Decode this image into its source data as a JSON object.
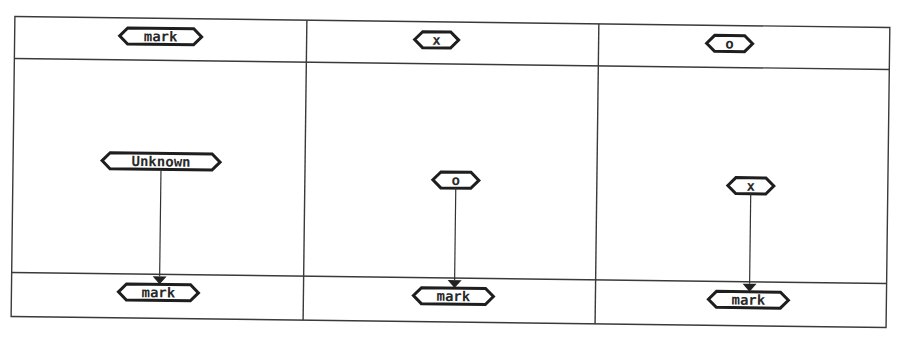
{
  "diagram": {
    "type": "table-flow-diagram",
    "columns": [
      {
        "header": "mark",
        "source": "Unknown",
        "target": "mark"
      },
      {
        "header": "x",
        "source": "o",
        "target": "mark"
      },
      {
        "header": "o",
        "source": "x",
        "target": "mark"
      }
    ],
    "colors": {
      "line": "#3a3a3a",
      "node_stroke": "#1e1e1e",
      "text": "#2a2a2a",
      "background": "#ffffff"
    }
  }
}
